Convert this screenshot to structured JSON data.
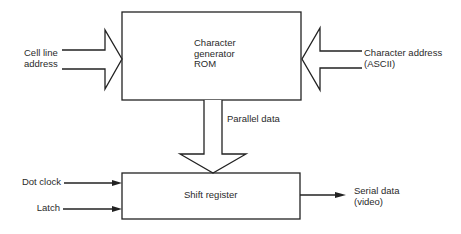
{
  "diagram": {
    "blocks": {
      "rom": {
        "line1": "Character",
        "line2": "generator",
        "line3": "ROM"
      },
      "shift_register": {
        "label": "Shift register"
      }
    },
    "inputs": {
      "cell_line_address": {
        "line1": "Cell line",
        "line2": "address"
      },
      "character_address": {
        "line1": "Character address",
        "line2": "(ASCII)"
      },
      "dot_clock": {
        "label": "Dot clock"
      },
      "latch": {
        "label": "Latch"
      }
    },
    "connections": {
      "parallel_data": {
        "label": "Parallel data"
      }
    },
    "outputs": {
      "serial_data": {
        "line1": "Serial data",
        "line2": "(video)"
      }
    },
    "colors": {
      "line": "#222222",
      "text": "#2a2a2a",
      "background": "#ffffff"
    }
  }
}
